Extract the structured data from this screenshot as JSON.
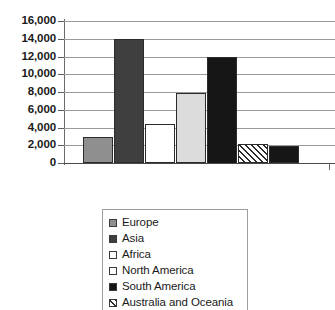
{
  "chart_data": {
    "type": "bar",
    "title": "",
    "xlabel": "",
    "ylabel": "",
    "ylim": [
      0,
      16000
    ],
    "ytick_step": 2000,
    "grid": true,
    "legend_position": "bottom",
    "categories": [
      "Europe",
      "Asia",
      "Africa",
      "North America",
      "South America",
      "Australia and Oceania",
      "Antarctica"
    ],
    "values": [
      2900,
      14000,
      4350,
      7900,
      12000,
      2100,
      1900
    ],
    "ytick_labels": [
      "16,000",
      "14,000",
      "12,000",
      "10,000",
      "8,000",
      "6,000",
      "4,000",
      "2,000",
      "0"
    ],
    "ytick_values": [
      16000,
      14000,
      12000,
      10000,
      8000,
      6000,
      4000,
      2000,
      0
    ],
    "bar_fills": [
      "medium-gray",
      "dark-gray",
      "white",
      "light-gray",
      "black",
      "hatch",
      "black"
    ],
    "colors": {
      "medium-gray": "#8f8f8f",
      "dark-gray": "#3f3f3f",
      "white": "#ffffff",
      "light-gray": "#dcdcdc",
      "black": "#161616",
      "hatch": "#ffffff",
      "bar_outline": "#2b2b2b",
      "gridline": "#9a9a9a",
      "axis": "#6a6a6a",
      "text": "#1a1a1a"
    }
  },
  "legend": {
    "items": [
      {
        "label": "Europe",
        "fill": "medium-gray"
      },
      {
        "label": "Asia",
        "fill": "dark-gray"
      },
      {
        "label": "Africa",
        "fill": "white"
      },
      {
        "label": "North America",
        "fill": "white"
      },
      {
        "label": "South America",
        "fill": "black"
      },
      {
        "label": "Australia and Oceania",
        "fill": "hatch"
      }
    ]
  }
}
